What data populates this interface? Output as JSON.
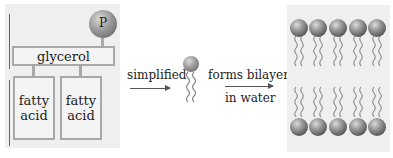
{
  "diagram": {
    "phospholipid": {
      "head_label": "P",
      "backbone_label": "glycerol",
      "tails": [
        {
          "label": "fatty\nacid",
          "line1": "fatty",
          "line2": "acid"
        },
        {
          "label": "fatty\nacid",
          "line1": "fatty",
          "line2": "acid"
        }
      ]
    },
    "step1": {
      "label": "simplified"
    },
    "step2": {
      "label_top": "forms bilayers",
      "label_bottom": "in water"
    },
    "bilayer": {
      "top_row_count": 5,
      "bottom_row_count": 5
    },
    "colors": {
      "panel_bg": "#efefef",
      "box_border": "#a8a8a8",
      "head_ball": "#8a8a8a",
      "tail": "#8c8c8c",
      "arrow": "#555555"
    }
  }
}
